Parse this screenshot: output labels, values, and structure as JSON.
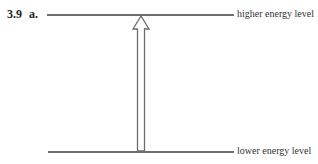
{
  "figure": {
    "number": "3.9",
    "part": "a."
  },
  "levels": {
    "higher": {
      "label": "higher energy level"
    },
    "lower": {
      "label": "lower energy level"
    }
  },
  "arrow": {
    "direction": "up",
    "from": "lower energy level",
    "to": "higher energy level"
  },
  "colors": {
    "line": "#6e6e6e",
    "arrow_fill": "#ffffff",
    "arrow_stroke": "#6e6e6e"
  }
}
